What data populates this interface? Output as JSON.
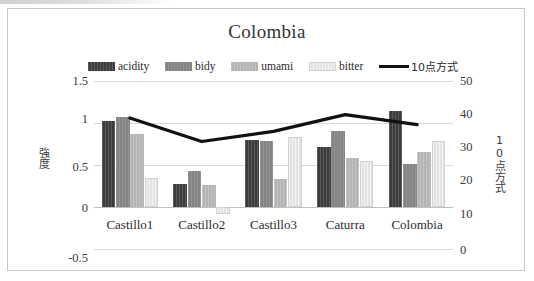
{
  "chart_data": {
    "type": "bar",
    "title": "Colombia",
    "categories": [
      "Castillo1",
      "Castillo2",
      "Castillo3",
      "Caturra",
      "Colombia"
    ],
    "series": [
      {
        "name": "acidity",
        "axis": "left",
        "color": "#3c3c3c",
        "values": [
          1.02,
          0.27,
          0.8,
          0.72,
          1.14
        ]
      },
      {
        "name": "bidy",
        "axis": "left",
        "color": "#848484",
        "values": [
          1.07,
          0.43,
          0.79,
          0.9,
          0.51
        ]
      },
      {
        "name": "umami",
        "axis": "left",
        "color": "#b4b4b4",
        "values": [
          0.87,
          0.26,
          0.33,
          0.58,
          0.65
        ]
      },
      {
        "name": "bitter",
        "axis": "left",
        "color": "#e3e3e3",
        "values": [
          0.35,
          -0.08,
          0.83,
          0.55,
          0.79
        ]
      },
      {
        "name": "10点方式",
        "axis": "right",
        "type": "line",
        "color": "#111111",
        "values": [
          39,
          32,
          35,
          40,
          37
        ]
      }
    ],
    "xlabel": "",
    "ylabel": "強度",
    "y2label": "10点方式",
    "ylim": [
      -0.5,
      1.5
    ],
    "y2lim": [
      0,
      50
    ],
    "yticks": [
      "1.5",
      "1",
      "0.5",
      "0",
      "-0.5"
    ],
    "y2ticks": [
      "50",
      "40",
      "30",
      "20",
      "10",
      "0"
    ],
    "grid": true,
    "legend_position": "top"
  },
  "legend": {
    "items": [
      {
        "label": "acidity",
        "swatch": "acidity-swatch"
      },
      {
        "label": "bidy",
        "swatch": "bidy-swatch"
      },
      {
        "label": "umami",
        "swatch": "umami-swatch"
      },
      {
        "label": "bitter",
        "swatch": "bitter-swatch"
      },
      {
        "label": "10点方式",
        "swatch": "line-swatch"
      }
    ]
  }
}
